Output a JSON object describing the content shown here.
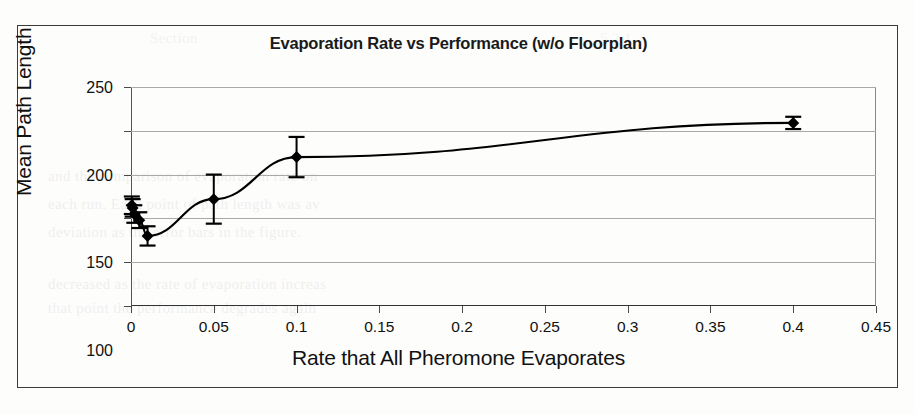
{
  "figure": {
    "title": "Evaporation Rate vs Performance (w/o Floorplan)",
    "frame_color": "#3a3a3a",
    "background": "#fdfdfc"
  },
  "ghost_text": {
    "line1": "and the comparison of evaporation rate on",
    "line2": "each run. Each point of path length was av",
    "line3": "deviation as the error bars in the figure.",
    "line4": "decreased as the rate of evaporation increas",
    "line5": "that point the performance degrades again",
    "line6": "Section",
    "line7": "5.2.1"
  },
  "chart_data": {
    "type": "scatter",
    "title": "Evaporation Rate vs Performance (w/o Floorplan)",
    "xlabel": "Rate that All Pheromone Evaporates",
    "ylabel": "Mean Path Length",
    "xlim": [
      0,
      0.45
    ],
    "ylim": [
      0,
      250
    ],
    "grid": true,
    "grid_axis": "y",
    "legend": "none",
    "marker": "diamond",
    "marker_color": "#000000",
    "line_color": "#000000",
    "error_bars": true,
    "xticks": [
      "0",
      "0.05",
      "0.1",
      "0.15",
      "0.2",
      "0.25",
      "0.3",
      "0.35",
      "0.4",
      "0.45"
    ],
    "xtick_values": [
      0,
      0.05,
      0.1,
      0.15,
      0.2,
      0.25,
      0.3,
      0.35,
      0.4,
      0.45
    ],
    "yticks": [
      "0",
      "50",
      "100",
      "150",
      "200",
      "250"
    ],
    "ytick_values": [
      0,
      50,
      100,
      150,
      200,
      250
    ],
    "x": [
      0.0005,
      0.001,
      0.002,
      0.005,
      0.01,
      0.05,
      0.1,
      0.4
    ],
    "y": [
      115,
      112,
      105,
      98,
      80,
      122,
      170,
      209
    ],
    "yerr": [
      10,
      10,
      10,
      9,
      11,
      28,
      23,
      7
    ],
    "points": [
      {
        "x": 0.0005,
        "y": 115,
        "yerr": 10
      },
      {
        "x": 0.001,
        "y": 112,
        "yerr": 10
      },
      {
        "x": 0.002,
        "y": 105,
        "yerr": 10
      },
      {
        "x": 0.005,
        "y": 98,
        "yerr": 9
      },
      {
        "x": 0.01,
        "y": 80,
        "yerr": 11
      },
      {
        "x": 0.05,
        "y": 122,
        "yerr": 28
      },
      {
        "x": 0.1,
        "y": 170,
        "yerr": 23
      },
      {
        "x": 0.4,
        "y": 209,
        "yerr": 7
      }
    ]
  }
}
